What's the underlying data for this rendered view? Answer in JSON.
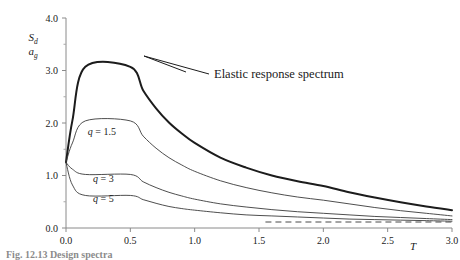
{
  "chart_data": {
    "type": "line",
    "title": "",
    "xlabel": "T",
    "ylabel": "Sd/ag",
    "ylabel_numerator": "S",
    "ylabel_numerator_sub": "d",
    "ylabel_denominator": "a",
    "ylabel_denominator_sub": "g",
    "xlim": [
      0.0,
      3.0
    ],
    "ylim": [
      0.0,
      4.0
    ],
    "xticks": [
      0.0,
      0.5,
      1.0,
      1.5,
      2.0,
      2.5,
      3.0
    ],
    "xtick_labels": [
      "0.0",
      "0.5",
      "1.0",
      "1.5",
      "2.0",
      "2.5",
      "3.0"
    ],
    "yticks": [
      0.0,
      1.0,
      2.0,
      3.0,
      4.0
    ],
    "ytick_labels": [
      "0.0",
      "1.0",
      "2.0",
      "3.0",
      "4.0"
    ],
    "yticks_minor": [
      0.5,
      1.5,
      2.5,
      3.5
    ],
    "grid": false,
    "legend_position": "inline-annotations",
    "annotations": [
      {
        "name": "elastic-response-spectrum",
        "text": "Elastic response spectrum",
        "x": 1.07,
        "y": 2.74
      }
    ],
    "series": [
      {
        "name": "Elastic response spectrum",
        "label": "Elastic response spectrum",
        "style": "solid-thick",
        "x": [
          0.0,
          0.05,
          0.15,
          0.5,
          0.6,
          0.7,
          0.8,
          0.9,
          1.0,
          1.2,
          1.4,
          1.6,
          1.8,
          2.0,
          2.2,
          2.4,
          2.6,
          2.8,
          3.0
        ],
        "y": [
          1.25,
          2.05,
          3.07,
          3.07,
          2.62,
          2.28,
          2.01,
          1.8,
          1.62,
          1.34,
          1.15,
          1.0,
          0.89,
          0.8,
          0.68,
          0.58,
          0.49,
          0.41,
          0.34
        ]
      },
      {
        "name": "q = 1.5",
        "label": "q = 1.5",
        "style": "solid-thin",
        "label_x": 0.17,
        "label_y": 1.78,
        "x": [
          0.0,
          0.05,
          0.15,
          0.5,
          0.6,
          0.7,
          0.8,
          0.9,
          1.0,
          1.2,
          1.4,
          1.6,
          1.8,
          2.0,
          2.2,
          2.4,
          2.6,
          2.8,
          3.0
        ],
        "y": [
          1.25,
          1.62,
          2.04,
          2.04,
          1.75,
          1.52,
          1.34,
          1.2,
          1.08,
          0.9,
          0.77,
          0.67,
          0.59,
          0.53,
          0.46,
          0.39,
          0.33,
          0.28,
          0.23
        ]
      },
      {
        "name": "q = 3",
        "label": "q = 3",
        "style": "solid-thin",
        "label_x": 0.21,
        "label_y": 0.88,
        "x": [
          0.0,
          0.05,
          0.15,
          0.5,
          0.6,
          0.7,
          0.8,
          0.9,
          1.0,
          1.2,
          1.4,
          1.6,
          1.8,
          2.0,
          2.2,
          2.4,
          2.6,
          2.8,
          3.0
        ],
        "y": [
          1.25,
          1.12,
          1.02,
          1.02,
          0.88,
          0.77,
          0.68,
          0.61,
          0.55,
          0.46,
          0.4,
          0.35,
          0.31,
          0.28,
          0.25,
          0.22,
          0.2,
          0.18,
          0.16
        ]
      },
      {
        "name": "q = 5",
        "label": "q = 5",
        "style": "solid-thin",
        "label_x": 0.21,
        "label_y": 0.5,
        "x": [
          0.0,
          0.05,
          0.15,
          0.5,
          0.6,
          0.7,
          0.8,
          0.9,
          1.0,
          1.2,
          1.4,
          1.6,
          1.8,
          2.0,
          2.2,
          2.4,
          2.6,
          2.8,
          3.0
        ],
        "y": [
          1.25,
          0.82,
          0.62,
          0.62,
          0.54,
          0.47,
          0.41,
          0.37,
          0.34,
          0.29,
          0.25,
          0.23,
          0.21,
          0.19,
          0.17,
          0.16,
          0.15,
          0.14,
          0.13
        ]
      },
      {
        "name": "lower bound",
        "label": "",
        "style": "dashed",
        "x": [
          1.55,
          3.0
        ],
        "y": [
          0.115,
          0.115
        ]
      }
    ]
  },
  "caption": {
    "text": "Fig. 12.13  Design spectra"
  }
}
